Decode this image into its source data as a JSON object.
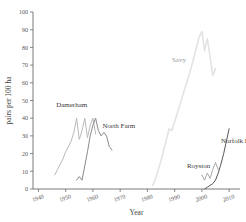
{
  "chart_data": {
    "type": "line",
    "title": "",
    "xlabel": "Year",
    "ylabel": "pairs per 100 ha",
    "xlim": [
      1938,
      2014
    ],
    "ylim": [
      0,
      100
    ],
    "xticks": [
      1940,
      1950,
      1960,
      1970,
      1980,
      1990,
      2000,
      2010
    ],
    "yticks": [
      0,
      10,
      20,
      30,
      40,
      50,
      60,
      70,
      80,
      90,
      100
    ],
    "grid": false,
    "legend": "inline-annotations",
    "series": [
      {
        "name": "Damerham",
        "color": "#b9b9b9",
        "label_x": 1946.5,
        "label_y": 46.5,
        "x": [
          1946,
          1947,
          1948,
          1949,
          1950,
          1951,
          1952,
          1953,
          1954,
          1955,
          1956,
          1957,
          1958,
          1959,
          1960,
          1961
        ],
        "y": [
          8,
          11,
          14,
          17,
          21,
          24,
          27,
          32,
          40,
          28,
          33,
          40,
          29,
          36,
          40,
          31
        ]
      },
      {
        "name": "North Farm",
        "color": "#8a8a8a",
        "label_x": 1963.5,
        "label_y": 34.5,
        "x": [
          1954,
          1955,
          1956,
          1957,
          1958,
          1959,
          1960,
          1961,
          1962,
          1963,
          1964,
          1965,
          1966,
          1967
        ],
        "y": [
          5,
          7,
          5,
          13,
          21,
          30,
          36,
          40,
          33,
          30,
          32,
          30,
          24,
          22
        ]
      },
      {
        "name": "Savy",
        "color": "#e3e3e3",
        "label_x": 1989.0,
        "label_y": 72.0,
        "x": [
          1982,
          1983,
          1984,
          1985,
          1986,
          1987,
          1988,
          1989,
          1990,
          1991,
          1992,
          1993,
          1994,
          1995,
          1996,
          1997,
          1998,
          1999,
          2000,
          2001,
          2002,
          2003,
          2004,
          2005
        ],
        "y": [
          2,
          6,
          11,
          16,
          22,
          28,
          34,
          33,
          38,
          43,
          48,
          53,
          58,
          63,
          68,
          74,
          80,
          86,
          89,
          78,
          85,
          75,
          64,
          68
        ]
      },
      {
        "name": "Royston",
        "color": "#a8a8a8",
        "label_x": 1994.5,
        "label_y": 12.0,
        "x": [
          2000,
          2001,
          2002,
          2003,
          2004,
          2005,
          2006
        ],
        "y": [
          8,
          5,
          9,
          6,
          11,
          15,
          11
        ]
      },
      {
        "name": "Norfolk Estate",
        "color": "#585858",
        "label_x": 2007.0,
        "label_y": 26.0,
        "x": [
          2001,
          2002,
          2003,
          2004,
          2005,
          2006,
          2007,
          2008,
          2009,
          2010
        ],
        "y": [
          0,
          1,
          2,
          3,
          5,
          9,
          14,
          20,
          27,
          34
        ]
      }
    ]
  }
}
